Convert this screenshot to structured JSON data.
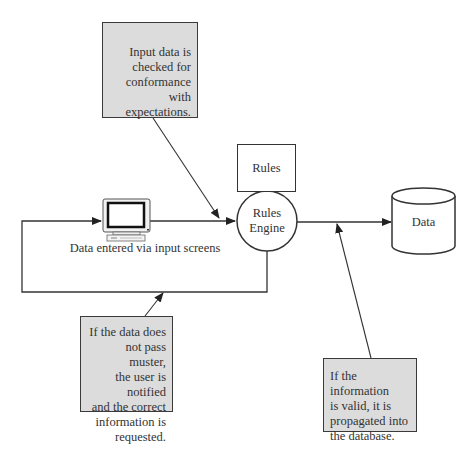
{
  "diagram": {
    "type": "flowchart",
    "colors": {
      "callout_fill": "#dcdcdc",
      "stroke": "#333333",
      "background": "#ffffff"
    },
    "nodes": {
      "input_screens": {
        "icon": "computer-monitor-icon",
        "label": "Data entered via input screens"
      },
      "rules": {
        "label": "Rules"
      },
      "rules_engine": {
        "line1": "Rules",
        "line2": "Engine"
      },
      "database": {
        "icon": "database-cylinder-icon",
        "label": "Data"
      }
    },
    "callouts": {
      "top": {
        "lines": [
          "Input data is",
          "checked  for",
          "conformance with",
          "expectations."
        ]
      },
      "bottom_left": {
        "lines": [
          "If the data does",
          "not pass muster,",
          "the user is notified",
          "and the correct",
          "information is",
          "requested."
        ]
      },
      "bottom_right": {
        "lines": [
          "If the information",
          "is valid, it is",
          "propagated into",
          "the database."
        ]
      }
    },
    "edges": [
      {
        "from": "input_screens",
        "to": "rules_engine"
      },
      {
        "from": "rules",
        "to": "rules_engine"
      },
      {
        "from": "rules_engine",
        "to": "database"
      },
      {
        "from": "rules_engine",
        "to": "input_screens",
        "label": "feedback loop"
      }
    ]
  }
}
